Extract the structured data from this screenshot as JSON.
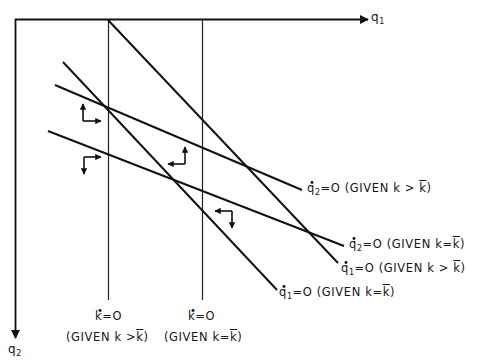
{
  "diagram": {
    "axes": {
      "x_label": "q",
      "x_sub": "1",
      "y_label": "q",
      "y_sub": "2"
    },
    "curves": [
      {
        "id": "q1dot-k-gt",
        "var": "q",
        "sub": "1",
        "eq": "=O",
        "given": "(GIVEN",
        "cond_k": "k",
        "cond_op": ">",
        "cond_kbar": "k",
        "close": ")"
      },
      {
        "id": "q1dot-k-eq",
        "var": "q",
        "sub": "1",
        "eq": "=O",
        "given": "(GIVEN",
        "cond_k": "k",
        "cond_op": "=",
        "cond_kbar": "k",
        "close": ")"
      },
      {
        "id": "q2dot-k-gt",
        "var": "q",
        "sub": "2",
        "eq": "=O",
        "given": "(GIVEN",
        "cond_k": "k",
        "cond_op": ">",
        "cond_kbar": "k",
        "close": ")"
      },
      {
        "id": "q2dot-k-eq",
        "var": "q",
        "sub": "2",
        "eq": "=O",
        "given": "(GIVEN",
        "cond_k": "k",
        "cond_op": "=",
        "cond_kbar": "k",
        "close": ")"
      }
    ],
    "verticals": [
      {
        "id": "kdot-k-gt",
        "top": "k",
        "eq": "=O",
        "given": "(GIVEN",
        "cond_k": "k",
        "cond_op": ">",
        "cond_kbar": "k",
        "close": ")"
      },
      {
        "id": "kdot-k-eq",
        "top": "k",
        "eq": "=O",
        "given": "(GIVEN",
        "cond_k": "k",
        "cond_op": "=",
        "cond_kbar": "k",
        "close": ")"
      }
    ],
    "dot": "•",
    "line_color": "#111111",
    "background": "#ffffff"
  }
}
